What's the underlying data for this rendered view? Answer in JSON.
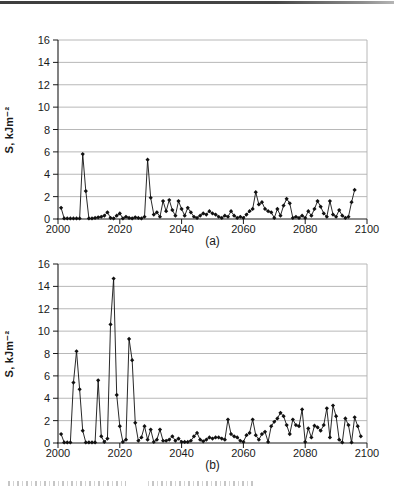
{
  "figure": {
    "panel_a_caption": "(a)",
    "panel_b_caption": "(b)",
    "y_axis_title": "S, kJm⁻²",
    "accent_colors": {
      "axis": "#1a1a1a",
      "grid": "#b0b0b0",
      "series": "#111111",
      "top_rule": "#3e3e3e"
    }
  },
  "chart_data": [
    {
      "type": "line",
      "title": "",
      "xlabel": "",
      "ylabel": "S, kJm⁻²",
      "caption": "(a)",
      "xlim": [
        2000,
        2100
      ],
      "ylim": [
        0,
        16
      ],
      "xticks": [
        2000,
        2020,
        2040,
        2060,
        2080,
        2100
      ],
      "yticks": [
        0,
        2,
        4,
        6,
        8,
        10,
        12,
        14,
        16
      ],
      "grid": "horizontal",
      "legend": "none",
      "marker": "diamond",
      "x_start": 2001,
      "x_step": 1,
      "values": [
        1.0,
        0.05,
        0.05,
        0.05,
        0.05,
        0.05,
        0.05,
        5.8,
        2.5,
        0.05,
        0.05,
        0.1,
        0.15,
        0.2,
        0.3,
        0.6,
        0.1,
        0.05,
        0.3,
        0.5,
        0.05,
        0.2,
        0.1,
        0.05,
        0.15,
        0.1,
        0.05,
        0.2,
        5.3,
        1.9,
        0.4,
        0.6,
        0.2,
        1.6,
        0.7,
        1.7,
        0.8,
        0.3,
        1.6,
        0.9,
        0.3,
        1.0,
        0.6,
        0.2,
        0.1,
        0.3,
        0.5,
        0.4,
        0.7,
        0.5,
        0.4,
        0.2,
        0.1,
        0.3,
        0.2,
        0.7,
        0.3,
        0.1,
        0.2,
        0.1,
        0.4,
        0.7,
        0.9,
        2.4,
        1.3,
        1.5,
        0.9,
        0.7,
        0.6,
        0.1,
        0.9,
        0.3,
        1.2,
        1.8,
        1.4,
        0.1,
        0.2,
        0.1,
        0.3,
        0.1,
        0.7,
        0.3,
        0.9,
        1.6,
        1.1,
        0.5,
        0.2,
        1.6,
        0.4,
        0.2,
        0.8,
        0.3,
        0.1,
        0.2,
        1.5,
        2.6
      ],
      "line_color": "#111111",
      "axis_color": "#1a1a1a",
      "grid_color": "#b0b0b0"
    },
    {
      "type": "line",
      "title": "",
      "xlabel": "",
      "ylabel": "S, kJm⁻²",
      "caption": "(b)",
      "xlim": [
        2000,
        2100
      ],
      "ylim": [
        0,
        16
      ],
      "xticks": [
        2000,
        2020,
        2040,
        2060,
        2080,
        2100
      ],
      "yticks": [
        0,
        2,
        4,
        6,
        8,
        10,
        12,
        14,
        16
      ],
      "grid": "horizontal",
      "legend": "none",
      "marker": "diamond",
      "x_start": 2001,
      "x_step": 1,
      "values": [
        0.8,
        0.05,
        0.05,
        0.05,
        5.4,
        8.2,
        4.8,
        1.1,
        0.05,
        0.05,
        0.05,
        0.05,
        5.6,
        0.6,
        0.1,
        0.4,
        10.6,
        14.7,
        4.3,
        1.5,
        0.1,
        0.3,
        9.3,
        7.4,
        1.8,
        0.2,
        0.5,
        1.5,
        0.3,
        1.2,
        0.1,
        0.3,
        1.2,
        0.2,
        0.2,
        0.3,
        0.6,
        0.2,
        0.4,
        0.1,
        0.1,
        0.1,
        0.2,
        0.6,
        0.9,
        0.3,
        0.15,
        0.3,
        0.5,
        0.4,
        0.5,
        0.5,
        0.4,
        0.3,
        2.1,
        0.8,
        0.6,
        0.5,
        0.2,
        0.1,
        0.7,
        0.9,
        2.1,
        0.7,
        0.3,
        0.8,
        1.0,
        0.1,
        1.5,
        1.9,
        2.2,
        2.7,
        2.4,
        1.6,
        0.8,
        2.1,
        1.6,
        1.5,
        3.0,
        0.1,
        1.3,
        0.5,
        1.55,
        1.4,
        1.1,
        1.6,
        3.1,
        0.5,
        3.35,
        2.4,
        0.3,
        0.05,
        2.2,
        1.6,
        0.05,
        2.3,
        1.5,
        0.6
      ],
      "line_color": "#111111",
      "axis_color": "#1a1a1a",
      "grid_color": "#b0b0b0"
    }
  ]
}
